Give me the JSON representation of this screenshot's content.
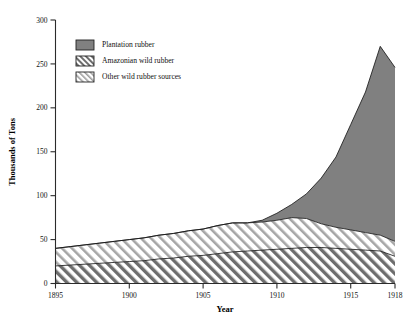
{
  "chart_data": {
    "type": "area",
    "stacked": true,
    "title": "",
    "xlabel": "Year",
    "ylabel": "Thousands of Tons",
    "xlim": [
      1895,
      1918
    ],
    "ylim": [
      0,
      300
    ],
    "xticks": [
      1895,
      1900,
      1905,
      1910,
      1915,
      1918
    ],
    "yticks": [
      0,
      50,
      100,
      150,
      200,
      250,
      300
    ],
    "grid": false,
    "legend_position": "top-left-inside",
    "x": [
      1895,
      1896,
      1897,
      1898,
      1899,
      1900,
      1901,
      1902,
      1903,
      1904,
      1905,
      1906,
      1907,
      1908,
      1909,
      1910,
      1911,
      1912,
      1913,
      1914,
      1915,
      1916,
      1917,
      1918
    ],
    "series": [
      {
        "name": "Amazonian wild rubber",
        "order": 1,
        "fill": "hatch-dark",
        "values": [
          20,
          21,
          22,
          23,
          24,
          25,
          26,
          28,
          29,
          31,
          32,
          34,
          36,
          37,
          38,
          39,
          40,
          41,
          41,
          40,
          39,
          38,
          37,
          31
        ]
      },
      {
        "name": "Other wild rubber sources",
        "order": 2,
        "fill": "hatch-light",
        "values": [
          20,
          21,
          22,
          23,
          24,
          25,
          26,
          27,
          28,
          29,
          30,
          32,
          33,
          32,
          32,
          33,
          35,
          33,
          27,
          24,
          22,
          20,
          18,
          17
        ]
      },
      {
        "name": "Plantation rubber",
        "order": 3,
        "fill": "solid-gray",
        "values": [
          0,
          0,
          0,
          0,
          0,
          0,
          0,
          0,
          0,
          0,
          0,
          0,
          0,
          0,
          2,
          8,
          15,
          28,
          52,
          80,
          120,
          160,
          215,
          198
        ]
      }
    ],
    "totals": [
      40,
      42,
      44,
      46,
      48,
      50,
      52,
      55,
      57,
      60,
      62,
      66,
      69,
      69,
      72,
      80,
      90,
      102,
      120,
      144,
      181,
      218,
      270,
      246
    ],
    "annotations": [
      "Plantation rubber overtakes wild rubber after 1913",
      "Peak total output approx. 270 thousand tons in 1917"
    ]
  },
  "legend": {
    "items": [
      {
        "label": "Plantation rubber",
        "swatch": "solid-gray",
        "color": "#808080"
      },
      {
        "label": "Amazonian wild rubber",
        "swatch": "hatch-dark",
        "color": "#6b6b6b"
      },
      {
        "label": "Other wild rubber sources",
        "swatch": "hatch-light",
        "color": "#9a9a9a"
      }
    ]
  },
  "axes": {
    "y_title": "Thousands of Tons",
    "x_title": "Year",
    "y_labels": [
      "300",
      "250",
      "200",
      "150",
      "100",
      "50",
      "0"
    ],
    "x_labels": [
      "1895",
      "1900",
      "1905",
      "1910",
      "1915",
      "1918"
    ]
  },
  "colors": {
    "plantation": "#808080",
    "hatch_dark_line": "#5e5e5e",
    "hatch_light_line": "#a0a0a0",
    "outline": "#1a1a1a",
    "axis": "#2b2b2b",
    "background": "#ffffff"
  }
}
